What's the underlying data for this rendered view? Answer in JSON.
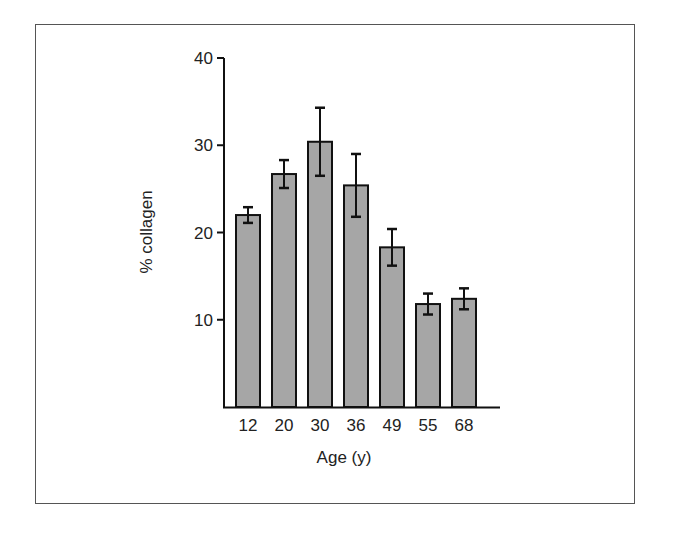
{
  "chart_data": {
    "type": "bar",
    "title": "",
    "xlabel": "Age (y)",
    "ylabel": "% collagen",
    "categories": [
      "12",
      "20",
      "30",
      "36",
      "49",
      "55",
      "68"
    ],
    "values": [
      22.0,
      26.7,
      30.4,
      25.4,
      18.3,
      11.8,
      12.4
    ],
    "error": [
      0.9,
      1.6,
      3.9,
      3.6,
      2.1,
      1.2,
      1.2
    ],
    "ylim": [
      0,
      40
    ],
    "yticks": [
      10,
      20,
      30,
      40
    ],
    "grid": false,
    "legend": null,
    "bar_color": "#a6a6a6",
    "edge_color": "#111111"
  }
}
